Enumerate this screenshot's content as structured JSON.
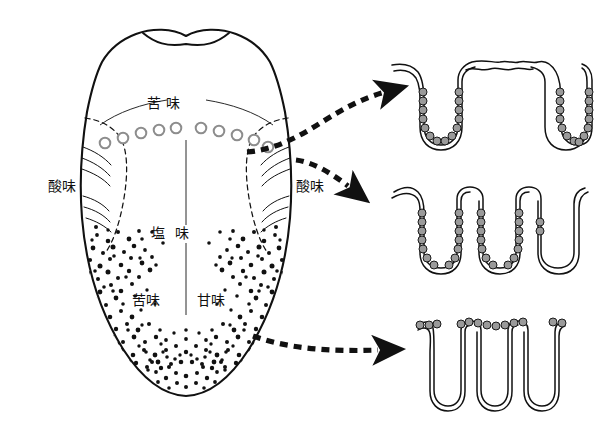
{
  "figure": {
    "kind": "anatomical-diagram",
    "background_color": "#ffffff",
    "ink_color": "#111111",
    "cell_fill_color": "#9a9a9a"
  },
  "tongue": {
    "name": "tongue-outline",
    "labels": [
      {
        "id": "bitter-top",
        "text": "苦 味",
        "x": 164,
        "y": 103,
        "align": "center"
      },
      {
        "id": "sour-left",
        "text": "酸味",
        "x": 62,
        "y": 186,
        "align": "center"
      },
      {
        "id": "sour-right",
        "text": "酸味",
        "x": 310,
        "y": 186,
        "align": "center"
      },
      {
        "id": "salty-middle",
        "text": "塩  味",
        "x": 170,
        "y": 233,
        "align": "center"
      },
      {
        "id": "bitter-bottom-left",
        "text": "苦味",
        "x": 146,
        "y": 300,
        "align": "center"
      },
      {
        "id": "sweet-bottom-right",
        "text": "甘味",
        "x": 211,
        "y": 300,
        "align": "center"
      }
    ],
    "circumvallate_papillae": {
      "name": "circumvallate-papillae-circles",
      "count_left": 5,
      "count_right": 5,
      "left": [
        {
          "cx": 105,
          "cy": 142,
          "r": 5.4
        },
        {
          "cx": 122,
          "cy": 137,
          "r": 5.4
        },
        {
          "cx": 140,
          "cy": 133,
          "r": 5.4
        },
        {
          "cx": 158,
          "cy": 130,
          "r": 5.4
        },
        {
          "cx": 176,
          "cy": 128,
          "r": 5.4
        }
      ],
      "right": [
        {
          "cx": 203,
          "cy": 128,
          "r": 5.4
        },
        {
          "cx": 221,
          "cy": 131,
          "r": 5.4
        },
        {
          "cx": 239,
          "cy": 135,
          "r": 5.4
        },
        {
          "cx": 256,
          "cy": 140,
          "r": 5.4
        },
        {
          "cx": 268,
          "cy": 146,
          "r": 5.4
        }
      ]
    },
    "fungiform_papillae_dots": {
      "name": "fungiform-papillae-dots",
      "left_cluster_count": 86,
      "right_cluster_count": 84,
      "tip_cluster_count": 72
    }
  },
  "arrows": [
    {
      "id": "arrow-to-top-diagram",
      "label": "",
      "from": {
        "x": 252,
        "y": 150
      },
      "to": {
        "x": 390,
        "y": 92
      }
    },
    {
      "id": "arrow-to-middle-diagram",
      "label": "",
      "from": {
        "x": 292,
        "y": 162
      },
      "to": {
        "x": 372,
        "y": 196
      }
    },
    {
      "id": "arrow-to-bottom-diagram",
      "label": "",
      "from": {
        "x": 250,
        "y": 334
      },
      "to": {
        "x": 392,
        "y": 349
      }
    }
  ],
  "papillae_diagrams": [
    {
      "id": "diagram-circumvallate",
      "name": "circumvallate-papilla-cross-section",
      "description": "deep trench with taste buds along both walls",
      "taste_bud_cell_count": 28
    },
    {
      "id": "diagram-foliate",
      "name": "foliate-papilla-cross-section",
      "description": "square folds with taste buds on the facing walls",
      "taste_bud_cell_count": 26
    },
    {
      "id": "diagram-fungiform",
      "name": "fungiform-papilla-cross-section",
      "description": "narrow clefts with taste buds on the upper surface",
      "taste_bud_cell_count": 13
    }
  ]
}
